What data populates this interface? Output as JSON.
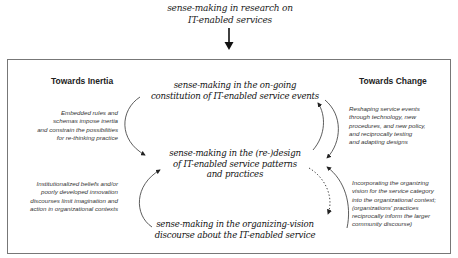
{
  "header": {
    "title_line1": "sense-making in research on",
    "title_line2": "IT-enabled services"
  },
  "diagram": {
    "left_heading": "Towards Inertia",
    "right_heading": "Towards Change",
    "nodes": {
      "top": {
        "line1": "sense-making in the on-going",
        "line2": "constitution of IT-enabled service events"
      },
      "middle": {
        "line1": "sense-making in the (re-)design",
        "line2": "of IT-enabled service patterns",
        "line3": "and practices"
      },
      "bottom": {
        "line1": "sense-making in the organizing-vision",
        "line2": "discourse about the IT-enabled service"
      }
    },
    "notes": {
      "left_top": [
        "Embedded rules and",
        "schemas impose inertia",
        "and constrain the possibilities",
        "for re-thinking practice"
      ],
      "left_bottom": [
        "Institutionalized beliefs and/or",
        "poorly developed innovation",
        "discourses limit imagination and",
        "action in organizational contexts"
      ],
      "right_top": [
        "Reshaping service events",
        "through technology, new",
        "procedures, and new policy,",
        "and reciprocally testing",
        "and adapting designs"
      ],
      "right_bottom": [
        "Incorporating the organizing",
        "vision for the service category",
        "into the organizational context;",
        "(organizations' practices",
        "reciprocally inform the larger",
        "community discourse)"
      ]
    },
    "arrows": [
      {
        "from": "header",
        "to": "frame",
        "style": "solid",
        "label": "down-arrow"
      },
      {
        "from": "top",
        "to": "middle",
        "side": "left",
        "style": "solid",
        "label": "inertia-arrow-top"
      },
      {
        "from": "bottom",
        "to": "middle",
        "side": "left",
        "style": "solid",
        "label": "inertia-arrow-bottom"
      },
      {
        "from": "middle",
        "to": "top",
        "side": "right",
        "style": "solid",
        "label": "change-arrow-up"
      },
      {
        "from": "top",
        "to": "middle",
        "side": "right",
        "style": "solid",
        "label": "change-arrow-down"
      },
      {
        "from": "middle",
        "to": "bottom",
        "side": "right",
        "style": "dotted",
        "label": "dotted-arrow"
      },
      {
        "from": "bottom",
        "to": "middle",
        "side": "right",
        "style": "solid",
        "label": "change-arrow-bottom-up"
      }
    ],
    "colors": {
      "line": "#333333",
      "frame": "#777777",
      "text": "#1a1a1a"
    }
  }
}
